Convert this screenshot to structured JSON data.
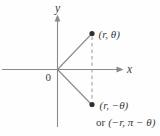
{
  "diagram": {
    "title_semantic": "polar-coordinates-symmetry-diagram",
    "colors": {
      "background": "#fefefe",
      "line": "#8a8a8a",
      "dash": "#a0a0a0",
      "dot": "#2f2f2f",
      "text": "#3b3b3b"
    },
    "axes": {
      "x_label": "x",
      "y_label": "y",
      "origin_label": "0"
    },
    "points": [
      {
        "name": "upper",
        "label": "(r, θ)"
      },
      {
        "name": "lower",
        "label": "(r, −θ)",
        "alt_prefix": "or",
        "alt_label": "(−r, π − θ)"
      }
    ]
  }
}
